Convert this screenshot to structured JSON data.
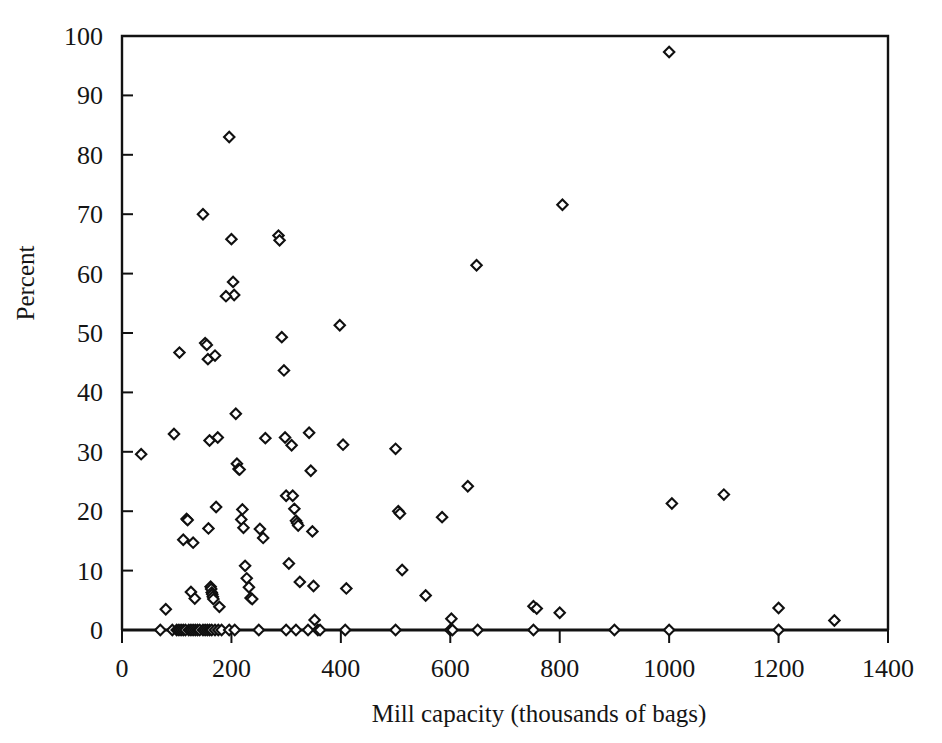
{
  "chart_data": {
    "type": "scatter",
    "title": "",
    "xlabel": "Mill capacity (thousands of bags)",
    "ylabel": "Percent",
    "xlim": [
      0,
      1400
    ],
    "ylim": [
      0,
      100
    ],
    "xticks": [
      0,
      200,
      400,
      600,
      800,
      1000,
      1200,
      1400
    ],
    "yticks": [
      0,
      10,
      20,
      30,
      40,
      50,
      60,
      70,
      80,
      90,
      100
    ],
    "grid": false,
    "legend": null,
    "marker": "open-diamond",
    "marker_color": "#101010",
    "points": [
      [
        35,
        29.6
      ],
      [
        80,
        3.5
      ],
      [
        95,
        33.0
      ],
      [
        105,
        46.7
      ],
      [
        112,
        15.2
      ],
      [
        118,
        18.7
      ],
      [
        120,
        18.5
      ],
      [
        126,
        6.4
      ],
      [
        130,
        14.7
      ],
      [
        133,
        5.3
      ],
      [
        148,
        70.0
      ],
      [
        152,
        48.3
      ],
      [
        155,
        48.0
      ],
      [
        157,
        45.6
      ],
      [
        158,
        17.1
      ],
      [
        160,
        31.9
      ],
      [
        162,
        7.3
      ],
      [
        163,
        6.9
      ],
      [
        164,
        6.3
      ],
      [
        165,
        6.0
      ],
      [
        166,
        5.6
      ],
      [
        167,
        5.2
      ],
      [
        170,
        46.2
      ],
      [
        172,
        20.7
      ],
      [
        175,
        32.4
      ],
      [
        178,
        3.9
      ],
      [
        196,
        83.0
      ],
      [
        200,
        65.8
      ],
      [
        203,
        58.6
      ],
      [
        205,
        56.4
      ],
      [
        190,
        56.2
      ],
      [
        208,
        36.4
      ],
      [
        210,
        28.0
      ],
      [
        213,
        27.1
      ],
      [
        215,
        27.0
      ],
      [
        218,
        18.6
      ],
      [
        220,
        20.3
      ],
      [
        222,
        17.2
      ],
      [
        225,
        10.8
      ],
      [
        228,
        8.7
      ],
      [
        232,
        7.2
      ],
      [
        235,
        5.4
      ],
      [
        238,
        5.2
      ],
      [
        252,
        17.0
      ],
      [
        258,
        15.5
      ],
      [
        262,
        32.3
      ],
      [
        286,
        66.4
      ],
      [
        288,
        65.6
      ],
      [
        292,
        49.3
      ],
      [
        296,
        43.7
      ],
      [
        298,
        32.4
      ],
      [
        300,
        22.6
      ],
      [
        305,
        11.2
      ],
      [
        310,
        31.1
      ],
      [
        312,
        22.6
      ],
      [
        315,
        20.4
      ],
      [
        318,
        18.4
      ],
      [
        320,
        18.0
      ],
      [
        322,
        17.6
      ],
      [
        325,
        8.1
      ],
      [
        342,
        33.2
      ],
      [
        345,
        26.8
      ],
      [
        348,
        16.6
      ],
      [
        350,
        7.4
      ],
      [
        352,
        1.7
      ],
      [
        398,
        51.3
      ],
      [
        404,
        31.2
      ],
      [
        410,
        7.0
      ],
      [
        500,
        30.5
      ],
      [
        505,
        20.0
      ],
      [
        508,
        19.6
      ],
      [
        512,
        10.1
      ],
      [
        555,
        5.8
      ],
      [
        585,
        19.0
      ],
      [
        602,
        1.9
      ],
      [
        632,
        24.2
      ],
      [
        648,
        61.4
      ],
      [
        752,
        4.0
      ],
      [
        758,
        3.6
      ],
      [
        800,
        2.9
      ],
      [
        805,
        71.6
      ],
      [
        1000,
        97.3
      ],
      [
        1005,
        21.3
      ],
      [
        1100,
        22.8
      ],
      [
        1200,
        3.7
      ],
      [
        1302,
        1.6
      ],
      [
        70,
        0
      ],
      [
        92,
        0
      ],
      [
        100,
        0
      ],
      [
        104,
        0
      ],
      [
        108,
        0
      ],
      [
        112,
        0
      ],
      [
        116,
        0
      ],
      [
        122,
        0
      ],
      [
        126,
        0
      ],
      [
        130,
        0
      ],
      [
        134,
        0
      ],
      [
        138,
        0
      ],
      [
        142,
        0
      ],
      [
        148,
        0
      ],
      [
        152,
        0
      ],
      [
        156,
        0
      ],
      [
        160,
        0
      ],
      [
        164,
        0
      ],
      [
        170,
        0
      ],
      [
        176,
        0
      ],
      [
        182,
        0
      ],
      [
        196,
        0
      ],
      [
        206,
        0
      ],
      [
        250,
        0
      ],
      [
        300,
        0
      ],
      [
        318,
        0
      ],
      [
        340,
        0
      ],
      [
        358,
        0
      ],
      [
        362,
        0
      ],
      [
        408,
        0
      ],
      [
        500,
        0
      ],
      [
        600,
        0
      ],
      [
        604,
        0
      ],
      [
        650,
        0
      ],
      [
        752,
        0
      ],
      [
        900,
        0
      ],
      [
        1000,
        0
      ],
      [
        1200,
        0
      ]
    ]
  },
  "axes": {
    "ylabel": "Percent",
    "xlabel": "Mill capacity (thousands of bags)",
    "ytick_labels": [
      "0",
      "10",
      "20",
      "30",
      "40",
      "50",
      "60",
      "70",
      "80",
      "90",
      "100"
    ],
    "xtick_labels": [
      "0",
      "200",
      "400",
      "600",
      "800",
      "1000",
      "1200",
      "1400"
    ]
  },
  "caption": {
    "text": ""
  }
}
